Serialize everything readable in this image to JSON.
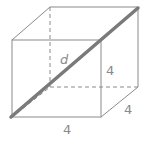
{
  "figure": {
    "type": "cube-space-diagonal",
    "labels": {
      "diagonal": "d",
      "height": "4",
      "depth": "4",
      "width": "4"
    },
    "colors": {
      "edges": "#8a8a8a",
      "diagonal": "#7a7a7a",
      "background": "#ffffff"
    }
  }
}
